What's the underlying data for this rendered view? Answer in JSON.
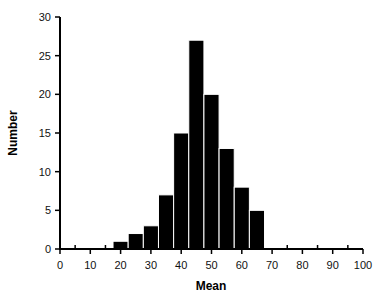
{
  "chart_data": {
    "type": "bar",
    "subtype": "histogram",
    "title": "",
    "xlabel": "Mean",
    "ylabel": "Number",
    "xlim": [
      0,
      100
    ],
    "ylim": [
      0,
      30
    ],
    "x_ticks": [
      0,
      10,
      20,
      30,
      40,
      50,
      60,
      70,
      80,
      90,
      100
    ],
    "x_minor_ticks": [
      5,
      15,
      25,
      35,
      45,
      55,
      65,
      75,
      85,
      95
    ],
    "y_ticks": [
      0,
      5,
      10,
      15,
      20,
      25,
      30
    ],
    "bin_width": 5,
    "categories": [
      20,
      25,
      30,
      35,
      40,
      45,
      50,
      55,
      60,
      65
    ],
    "bin_edges": [
      17.5,
      22.5,
      27.5,
      32.5,
      37.5,
      42.5,
      47.5,
      52.5,
      57.5,
      62.5,
      67.5
    ],
    "values": [
      1,
      2,
      3,
      7,
      15,
      27,
      20,
      13,
      8,
      5
    ],
    "grid": false,
    "legend": null,
    "bar_color": "#000000"
  }
}
